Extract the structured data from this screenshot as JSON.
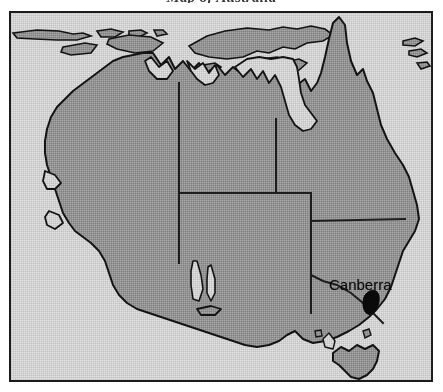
{
  "figure": {
    "kind": "scanned-map-plate",
    "title_remnant": "Map of Australia",
    "frame_color": "#1c1c1c"
  },
  "map": {
    "region_name": "Australia",
    "ocean_color": "#dcdcdc",
    "land_color": "#9a9a9a",
    "coast_line_color": "#141414",
    "border_line_color": "#1e1e1e",
    "labels": [
      {
        "name": "Canberra",
        "text": "Canberra",
        "type": "capital-city",
        "x": 318,
        "y": 263
      }
    ],
    "markers": [
      {
        "name": "australian-capital-territory",
        "type": "territory-marker",
        "color": "#0a0a0a",
        "x": 365,
        "y": 292
      }
    ],
    "state_boundaries": [
      "Western Australia / Northern Territory",
      "Northern Territory / Queensland",
      "Western Australia / South Australia",
      "South Australia / Northern Territory",
      "South Australia / Queensland",
      "South Australia / New South Wales",
      "New South Wales / Queensland",
      "New South Wales / Victoria",
      "South Australia / Victoria"
    ],
    "islands": [
      "Tasmania",
      "Timor",
      "New Guinea (partial)",
      "Lesser Sunda Islands"
    ]
  }
}
